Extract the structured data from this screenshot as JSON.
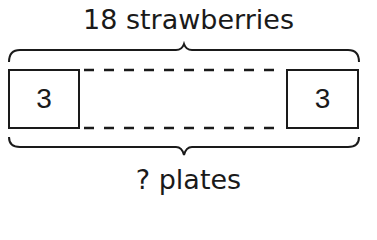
{
  "diagram": {
    "top_label": "18 strawberries",
    "bottom_label": "? plates",
    "boxes": [
      {
        "position": "first",
        "value": "3"
      },
      {
        "position": "last",
        "value": "3"
      }
    ],
    "connector_style": "dashed",
    "braces": [
      "top",
      "bottom"
    ],
    "colors": {
      "stroke": "#1a1a1a",
      "background": "#ffffff"
    }
  }
}
